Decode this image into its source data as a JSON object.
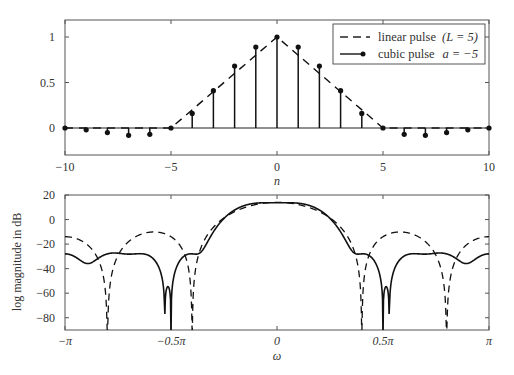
{
  "chart_data": [
    {
      "type": "stem",
      "title": "",
      "xlabel": "n",
      "ylabel": "",
      "xlim": [
        -10,
        10
      ],
      "ylim": [
        -0.3,
        1.2
      ],
      "xticks": [
        -10,
        -5,
        0,
        5,
        10
      ],
      "xtick_labels": [
        "−10",
        "−5",
        "0",
        "5",
        "10"
      ],
      "yticks": [
        0,
        0.5,
        1
      ],
      "ytick_labels": [
        "0",
        "0.5",
        "1"
      ],
      "grid": false,
      "legend_position": "upper right",
      "series": [
        {
          "name": "linear pulse",
          "param": "(L = 5)",
          "style": "dashed",
          "type": "line",
          "x": [
            -10,
            -5,
            0,
            5,
            10
          ],
          "values": [
            0,
            0,
            1,
            0,
            0
          ]
        },
        {
          "name": "cubic pulse",
          "param": "a = −5",
          "style": "stem",
          "type": "stem",
          "x": [
            -10,
            -9,
            -8,
            -7,
            -6,
            -5,
            -4,
            -3,
            -2,
            -1,
            0,
            1,
            2,
            3,
            4,
            5,
            6,
            7,
            8,
            9,
            10
          ],
          "values": [
            0,
            -0.02,
            -0.05,
            -0.08,
            -0.07,
            0,
            0.16,
            0.41,
            0.68,
            0.89,
            1.0,
            0.89,
            0.68,
            0.41,
            0.16,
            0,
            -0.07,
            -0.08,
            -0.05,
            -0.02,
            0
          ]
        }
      ]
    },
    {
      "type": "line",
      "title": "",
      "xlabel": "ω",
      "ylabel": "log magnitude in dB",
      "xlim": [
        -3.14159,
        3.14159
      ],
      "ylim": [
        -90,
        20
      ],
      "xticks": [
        -1,
        -0.5,
        0,
        0.5,
        1
      ],
      "xtick_labels": [
        "−π",
        "−0.5π",
        "0",
        "0.5π",
        "π"
      ],
      "yticks": [
        20,
        0,
        -20,
        -40,
        -60,
        -80
      ],
      "ytick_labels": [
        "20",
        "0",
        "−20",
        "−40",
        "−60",
        "−80"
      ],
      "grid": false,
      "series": [
        {
          "name": "linear pulse (L = 5)",
          "style": "dashed",
          "derived_from": "DTFT of linear pulse samples",
          "peak_db": 14,
          "nulls_over_pi": [
            0.4,
            0.8
          ],
          "sidelobe_db": [
            -10,
            -14
          ]
        },
        {
          "name": "cubic pulse a = −5",
          "style": "solid",
          "derived_from": "DTFT of cubic pulse samples",
          "peak_db": 13.7,
          "nulls_over_pi": [
            0.4,
            0.55,
            0.8,
            0.92
          ],
          "sidelobe_db": [
            -28,
            -32,
            -42,
            -56
          ]
        }
      ]
    }
  ],
  "legend": {
    "items": [
      {
        "label": "linear pulse",
        "param": "(L = 5)"
      },
      {
        "label": "cubic pulse",
        "param": "a = −5"
      }
    ]
  }
}
